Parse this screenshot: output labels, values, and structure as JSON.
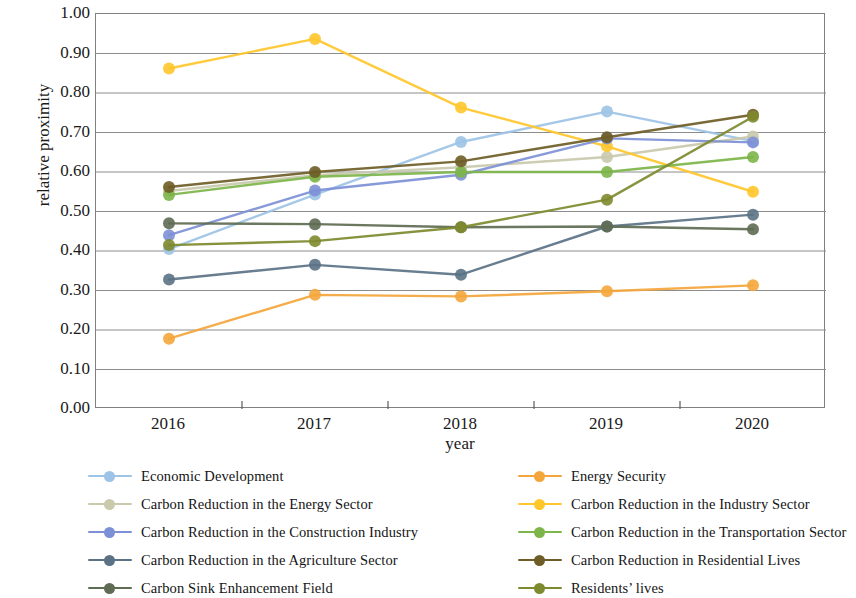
{
  "chart_data": {
    "type": "line",
    "title": "",
    "xlabel": "year",
    "ylabel": "relative proximity",
    "categories": [
      "2016",
      "2017",
      "2018",
      "2019",
      "2020"
    ],
    "x_tick_labels": [
      "2016",
      "2017",
      "2018",
      "2019",
      "2020"
    ],
    "y_tick_labels": [
      "0.00",
      "0.10",
      "0.20",
      "0.30",
      "0.40",
      "0.50",
      "0.60",
      "0.70",
      "0.80",
      "0.90",
      "1.00"
    ],
    "y_tick_values": [
      0.0,
      0.1,
      0.2,
      0.3,
      0.4,
      0.5,
      0.6,
      0.7,
      0.8,
      0.9,
      1.0
    ],
    "ylim": [
      0.0,
      1.0
    ],
    "grid": "horizontal",
    "legend_position": "bottom",
    "legend_columns": 2,
    "marker": "circle",
    "series": [
      {
        "name": "Economic Development",
        "color": "#9DC3E6",
        "values": [
          0.405,
          0.543,
          0.676,
          0.753,
          0.678
        ]
      },
      {
        "name": "Energy Security",
        "color": "#F4A63C",
        "values": [
          0.178,
          0.289,
          0.285,
          0.298,
          0.313
        ]
      },
      {
        "name": "Carbon Reduction in the Energy Sector",
        "color": "#C9C9AC",
        "values": [
          0.552,
          0.592,
          0.612,
          0.638,
          0.69
        ]
      },
      {
        "name": "Carbon Reduction in the Industry Sector",
        "color": "#FFC72C",
        "values": [
          0.862,
          0.937,
          0.763,
          0.665,
          0.55
        ]
      },
      {
        "name": "Carbon Reduction in the Construction Industry",
        "color": "#7D90D6",
        "values": [
          0.44,
          0.553,
          0.593,
          0.685,
          0.675
        ]
      },
      {
        "name": "Carbon Reduction in the Transportation Sector",
        "color": "#7DB54A",
        "values": [
          0.542,
          0.588,
          0.6,
          0.6,
          0.638
        ]
      },
      {
        "name": "Carbon Reduction in the Agriculture Sector",
        "color": "#5B7285",
        "values": [
          0.328,
          0.365,
          0.34,
          0.462,
          0.492
        ]
      },
      {
        "name": "Carbon Reduction in Residential Lives",
        "color": "#6E5D26",
        "values": [
          0.562,
          0.6,
          0.627,
          0.688,
          0.745
        ]
      },
      {
        "name": "Carbon Sink Enhancement Field",
        "color": "#5F6B53",
        "values": [
          0.47,
          0.468,
          0.46,
          0.462,
          0.455
        ]
      },
      {
        "name": "Residents’  lives",
        "color": "#7E8A2E",
        "values": [
          0.415,
          0.425,
          0.46,
          0.53,
          0.74
        ]
      }
    ]
  },
  "legend": {
    "left_column": [
      "Economic Development",
      "Carbon Reduction in the Energy Sector",
      "Carbon Reduction in the Construction Industry",
      "Carbon Reduction in the Agriculture Sector",
      "Carbon Sink Enhancement Field"
    ],
    "right_column": [
      "Energy Security",
      "Carbon Reduction in the Industry Sector",
      "Carbon Reduction in the Transportation Sector",
      "Carbon Reduction in Residential Lives",
      "Residents’  lives"
    ]
  }
}
